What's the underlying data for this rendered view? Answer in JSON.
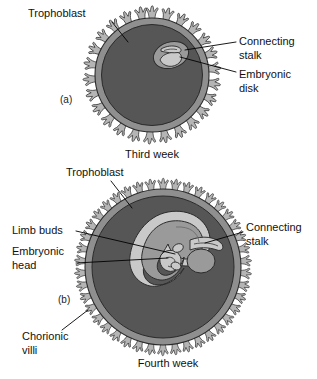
{
  "figure": {
    "title_alt": "Development of the chorionic vesicle at third and fourth week",
    "background_color": "#ffffff",
    "ink_color": "#000000"
  },
  "colors": {
    "chorion_interior": "#565656",
    "trophoblast_ring": "#8f8f8f",
    "villi_fill": "#b5b5b5",
    "villi_outline": "#2b2b2b",
    "embryo_light": "#c9c9c9",
    "embryo_mid": "#9a9a9a",
    "embryo_dark": "#6e6e6e",
    "label_text": "#111111",
    "leader_line": "#000000"
  },
  "panels": [
    {
      "id": "a",
      "panel_label": "(a)",
      "caption": "Third week",
      "center": {
        "x": 152,
        "y": 75
      },
      "radius": 57,
      "labels": [
        {
          "key": "trophoblast",
          "text": "Trophoblast",
          "text_x": 28,
          "text_y": 14,
          "anchor": "start",
          "leader": "M 112,22 L 128,42"
        },
        {
          "key": "connecting-stalk",
          "text_lines": [
            "Connecting",
            "stalk"
          ],
          "text_x": 239,
          "text_y": 42,
          "anchor": "start",
          "leader": "M 236,42 L 185,50"
        },
        {
          "key": "embryonic-disk",
          "text_lines": [
            "Embryonic",
            "disk"
          ],
          "text_x": 239,
          "text_y": 75,
          "anchor": "start",
          "leader": "M 236,72 L 180,57"
        }
      ]
    },
    {
      "id": "b",
      "panel_label": "(b)",
      "caption": "Fourth week",
      "center": {
        "x": 163,
        "y": 267
      },
      "radius": 78,
      "labels": [
        {
          "key": "trophoblast",
          "text": "Trophoblast",
          "text_x": 66,
          "text_y": 173,
          "anchor": "start",
          "leader": "M 111,181 L 132,208"
        },
        {
          "key": "limb-buds",
          "text": "Limb buds",
          "text_x": 12,
          "text_y": 231,
          "anchor": "start",
          "leader": "M 76,231 L 175,254"
        },
        {
          "key": "embryonic-head",
          "text_lines": [
            "Embryonic",
            "head"
          ],
          "text_x": 12,
          "text_y": 252,
          "anchor": "start",
          "leader": "M 76,263 L 168,258"
        },
        {
          "key": "connecting-stalk",
          "text_lines": [
            "Connecting",
            "stalk"
          ],
          "text_x": 246,
          "text_y": 228,
          "anchor": "start",
          "leader": "M 243,232 L 205,243"
        },
        {
          "key": "chorionic-villi",
          "text_lines": [
            "Chorionic",
            "villi"
          ],
          "text_x": 22,
          "text_y": 337,
          "anchor": "start",
          "leader": "M 62,330 L 88,310"
        }
      ]
    }
  ],
  "panel_label_positions": {
    "a": {
      "x": 60,
      "y": 100
    },
    "b": {
      "x": 58,
      "y": 300
    }
  },
  "caption_positions": {
    "a": {
      "x": 152,
      "y": 155
    },
    "b": {
      "x": 168,
      "y": 364
    }
  },
  "structures": {
    "a": {
      "embryonic_disk": "small oval pale mass in upper-right of chorionic cavity",
      "connecting_stalk": "short pale band linking disk to trophoblast wall",
      "villi_count": 26
    },
    "b": {
      "embryo": "C-shaped curled embryo with head, limb buds and tail",
      "amnion": "pale sac surrounding embryo",
      "yolk_sac": "rounded pale body right of embryo",
      "connecting_stalk": "band from embryo toward trophoblast at right",
      "villi_count": 42
    }
  }
}
